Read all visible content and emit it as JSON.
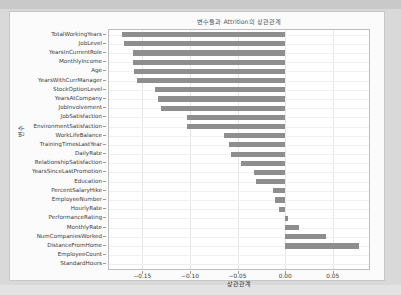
{
  "figure": {
    "title": "변수들과 Attrition의 상관관계",
    "xlabel": "상관관계",
    "ylabel": "변수",
    "bar_color": "#8e8e8e",
    "axes_bg": "#ffffff",
    "figure_bg": "#fbfbfb"
  },
  "chart_data": {
    "type": "bar",
    "orientation": "horizontal",
    "title": "변수들과 Attrition의 상관관계",
    "xlabel": "상관관계",
    "ylabel": "변수",
    "grid": true,
    "legend": null,
    "xlim": [
      -0.185,
      0.088
    ],
    "xticks": [
      -0.15,
      -0.1,
      -0.05,
      0.0,
      0.05
    ],
    "xticklabels": [
      "−0.15",
      "−0.10",
      "−0.05",
      "0.00",
      "0.05"
    ],
    "categories": [
      "TotalWorkingYears",
      "JobLevel",
      "YearsInCurrentRole",
      "MonthlyIncome",
      "Age",
      "YearsWithCurrManager",
      "StockOptionLevel",
      "YearsAtCompany",
      "JobInvolvement",
      "JobSatisfaction",
      "EnvironmentSatisfaction",
      "WorkLifeBalance",
      "TrainingTimesLastYear",
      "DailyRate",
      "RelationshipSatisfaction",
      "YearsSinceLastPromotion",
      "Education",
      "PercentSalaryHike",
      "EmployeeNumber",
      "HourlyRate",
      "PerformanceRating",
      "MonthlyRate",
      "NumCompaniesWorked",
      "DistanceFromHome",
      "EmployeeCount",
      "StandardHours"
    ],
    "values": [
      -0.171,
      -0.169,
      -0.16,
      -0.16,
      -0.159,
      -0.156,
      -0.137,
      -0.134,
      -0.13,
      -0.103,
      -0.103,
      -0.064,
      -0.059,
      -0.057,
      -0.046,
      -0.033,
      -0.031,
      -0.013,
      -0.011,
      -0.007,
      0.003,
      0.015,
      0.043,
      0.078,
      0.0,
      0.0
    ]
  }
}
